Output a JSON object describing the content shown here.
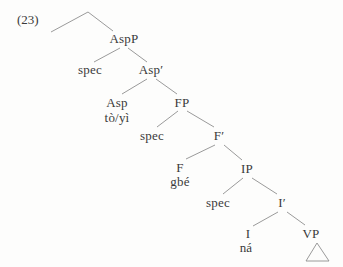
{
  "example_number": "(23)",
  "colors": {
    "text": "#3a3a3a",
    "branch": "#8f8f8f",
    "background": "#fdfdfc"
  },
  "tree": {
    "aspp": "AspP",
    "spec1": "spec",
    "asp_bar": "Asp′",
    "asp_head": "Asp",
    "asp_morpheme": "tò/yì",
    "fp": "FP",
    "spec2": "spec",
    "f_bar": "F′",
    "f_head": "F",
    "f_morpheme": "gbé",
    "ip": "IP",
    "spec3": "spec",
    "i_bar": "I′",
    "i_head": "I",
    "i_morpheme": "ná",
    "vp": "VP"
  }
}
